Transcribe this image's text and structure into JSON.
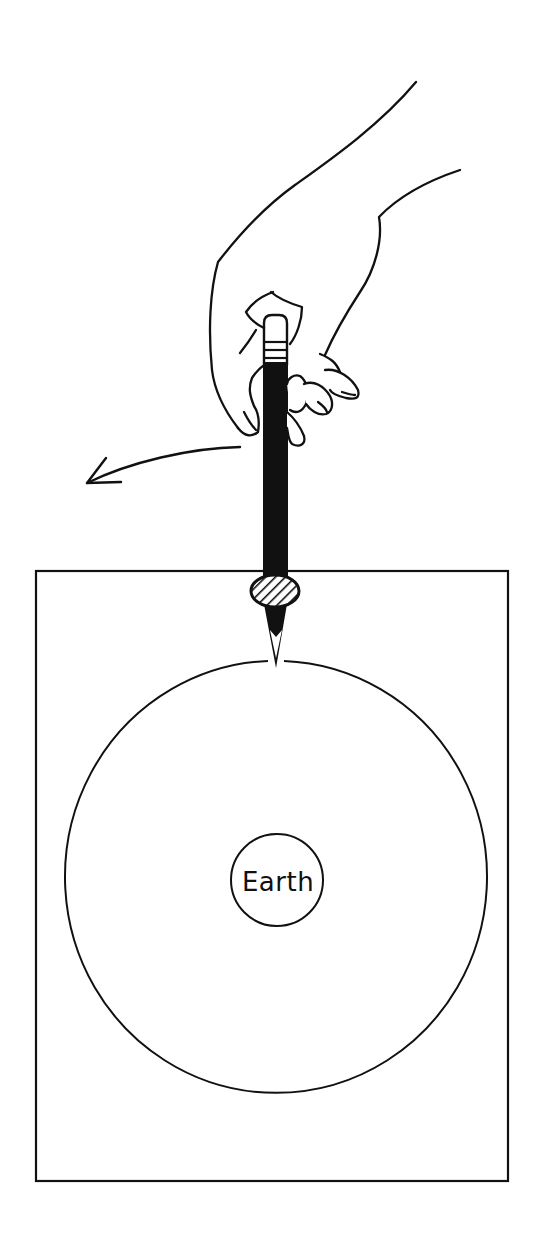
{
  "figure": {
    "colors": {
      "background": "#ffffff",
      "ink": "#111111"
    },
    "labels": {
      "earth": "Earth"
    },
    "elements": {
      "paper_sheet": {
        "x": 35,
        "y": 571,
        "width": 473,
        "height": 610
      },
      "orbit_circle": {
        "cx": 274,
        "cy": 876,
        "rx": 211,
        "ry": 216
      },
      "earth_circle": {
        "cx": 277,
        "cy": 880,
        "r": 46
      },
      "pushpin": {
        "cx": 275,
        "cy": 591,
        "rx": 25,
        "ry": 17
      },
      "pencil": {
        "x_left": 263,
        "x_right": 287,
        "top": 315,
        "tip_y": 667
      },
      "motion_arrow": {
        "from": [
          240,
          447
        ],
        "to": [
          86,
          483
        ],
        "direction": "left"
      }
    }
  }
}
